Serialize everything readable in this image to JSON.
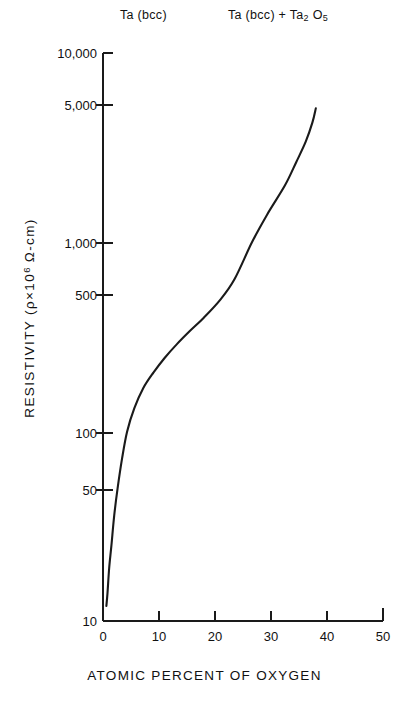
{
  "chart_data": {
    "type": "line",
    "title": "",
    "xlabel": "ATOMIC PERCENT OF OXYGEN",
    "ylabel": "RESISTIVITY (ρ×10⁶ Ω-cm)",
    "ylabel_parts": {
      "pre": "RESISTIVITY (",
      "rho": "ρ",
      "times": "×10",
      "exp": "6",
      "post": " Ω-cm)"
    },
    "xscale": "linear",
    "yscale": "log",
    "xlim": [
      0,
      50
    ],
    "ylim": [
      10,
      10000
    ],
    "grid": false,
    "legend": null,
    "xticks": [
      0,
      10,
      20,
      30,
      40,
      50
    ],
    "xtick_labels": [
      "0",
      "10",
      "20",
      "30",
      "40",
      "50"
    ],
    "yticks": [
      10,
      50,
      100,
      500,
      1000,
      5000,
      10000
    ],
    "ytick_labels": [
      "10",
      "50",
      "100",
      "500",
      "1,000",
      "5,000",
      "10,000"
    ],
    "series": [
      {
        "name": "resistivity vs oxygen content",
        "x": [
          0.6,
          0.8,
          1.1,
          1.5,
          2.0,
          2.6,
          3.4,
          4.3,
          5.6,
          7.2,
          9.0,
          11.0,
          13.2,
          15.5,
          18.0,
          21.0,
          23.5,
          26.6,
          29.3,
          32.5,
          34.5,
          36.2,
          37.4,
          38.0
        ],
        "y": [
          12,
          14,
          19,
          25,
          36,
          50,
          72,
          100,
          133,
          170,
          205,
          245,
          290,
          340,
          400,
          500,
          640,
          1000,
          1400,
          2000,
          2650,
          3400,
          4300,
          5100
        ]
      }
    ],
    "annotations": [
      {
        "name": "phase-region-left",
        "text_parts": {
          "main": "Ta (bcc)"
        }
      },
      {
        "name": "phase-region-right",
        "text_parts": {
          "a": "Ta  (bcc) + Ta",
          "sub1": "2",
          "b": " O",
          "sub2": "5"
        }
      }
    ]
  },
  "axes": {
    "y_title_pre": "RESISTIVITY (",
    "y_title_rho": "ρ",
    "y_title_x10": "×10",
    "y_title_exp": "6",
    "y_title_post": " Ω-cm)",
    "x_title": "ATOMIC PERCENT OF OXYGEN"
  },
  "labels": {
    "phase_left": "Ta (bcc)",
    "phase_right_a": "Ta  (bcc) + Ta",
    "phase_right_sub1": "2",
    "phase_right_b": " O",
    "phase_right_sub2": "5"
  },
  "style": {
    "curve_color": "#1a1a1a",
    "axis_color": "#1a1a1a",
    "background": "#ffffff"
  }
}
